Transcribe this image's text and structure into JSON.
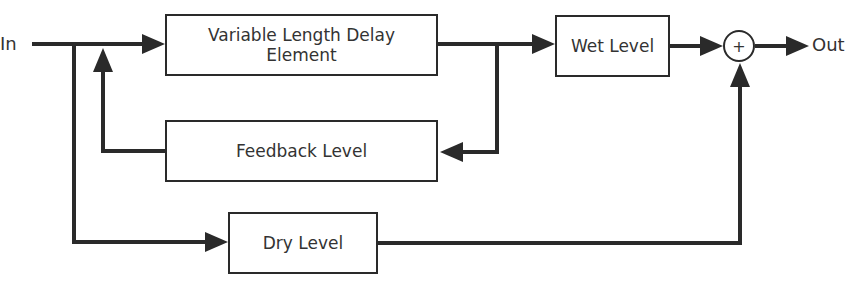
{
  "diagram": {
    "input_label": "In",
    "output_label": "Out",
    "blocks": {
      "delay": {
        "line1": "Variable Length Delay",
        "line2": "Element"
      },
      "wet": "Wet Level",
      "feedback": "Feedback Level",
      "dry": "Dry Level"
    },
    "summing_junction": "+",
    "colors": {
      "line": "#2a2a2a",
      "background": "#ffffff"
    }
  }
}
